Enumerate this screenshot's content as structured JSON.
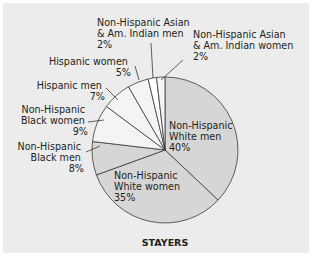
{
  "chart_data": {
    "type": "pie",
    "title": "STAYERS",
    "categories": [
      "Non-Hispanic White men",
      "Non-Hispanic White women",
      "Non-Hispanic Black men",
      "Non-Hispanic Black women",
      "Hispanic men",
      "Hispanic women",
      "Non-Hispanic Asian & Am. Indian men",
      "Non-Hispanic Asian & Am. Indian women"
    ],
    "values": [
      40,
      35,
      8,
      9,
      7,
      5,
      2,
      2
    ],
    "unit": "%",
    "colors": [
      "#d6d6d6",
      "#d6d6d6",
      "#d6d6d6",
      "#f4f4f4",
      "#f4f4f4",
      "#f4f4f4",
      "#ffffff",
      "#f4f4f4"
    ],
    "start_angle_deg": 0,
    "direction": "clockwise from 12 o'clock",
    "legend": "none (callout labels)"
  },
  "labels": {
    "white_men": [
      "Non-Hispanic",
      "White men",
      "40%"
    ],
    "white_women": [
      "Non-Hispanic",
      "White women",
      "35%"
    ],
    "black_men": [
      "Non-Hispanic",
      "Black men",
      "8%"
    ],
    "black_women": [
      "Non-Hispanic",
      "Black women",
      "9%"
    ],
    "hispanic_men": [
      "Hispanic men",
      "7%"
    ],
    "hispanic_women": [
      "Hispanic women",
      "5%"
    ],
    "asian_men": [
      "Non-Hispanic Asian",
      "& Am. Indian men",
      "2%"
    ],
    "asian_women": [
      "Non-Hispanic Asian",
      "& Am. Indian women",
      "2%"
    ]
  },
  "title": "STAYERS"
}
